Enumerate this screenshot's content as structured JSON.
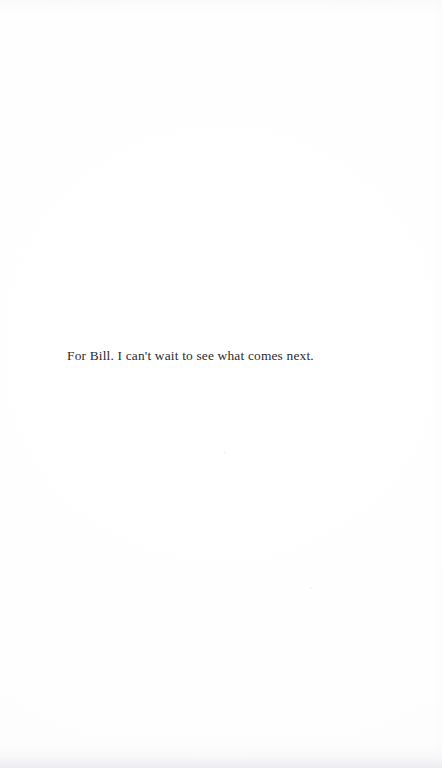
{
  "page": {
    "kind": "book-dedication-page",
    "background_color": "#fefefe",
    "width": 442,
    "height": 768
  },
  "dedication": {
    "text": "For Bill. I can't wait to see what comes next.",
    "color": "#2b2b2d",
    "alignment": "left",
    "font_size_px": 13.4
  },
  "artifacts": {
    "bottom_scan_shadow_color": "#eaeaee",
    "top_scan_haze_color": "#f5f5f8",
    "speck_color": "#f4f4f5"
  }
}
